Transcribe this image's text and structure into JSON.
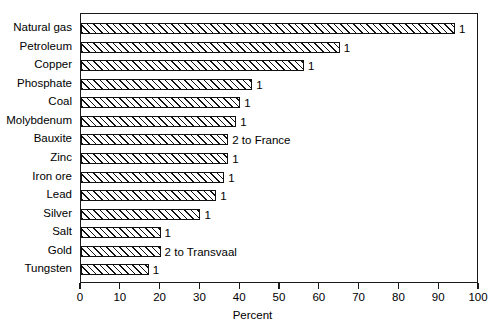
{
  "chart_data": {
    "type": "bar",
    "orientation": "horizontal",
    "title": "",
    "xlabel": "Percent",
    "ylabel": "",
    "xlim": [
      0,
      100
    ],
    "xticks": [
      0,
      10,
      20,
      30,
      40,
      50,
      60,
      70,
      80,
      90,
      100
    ],
    "xtick_labels": [
      "0",
      "10",
      "20",
      "30",
      "40",
      "50",
      "60",
      "70",
      "80",
      "90",
      "100"
    ],
    "grid": false,
    "legend": "none",
    "categories": [
      "Natural gas",
      "Petroleum",
      "Copper",
      "Phosphate",
      "Coal",
      "Molybdenum",
      "Bauxite",
      "Zinc",
      "Iron ore",
      "Lead",
      "Silver",
      "Salt",
      "Gold",
      "Tungsten"
    ],
    "values": [
      94,
      65,
      56,
      43,
      40,
      39,
      37,
      37,
      36,
      34,
      30,
      20,
      20,
      17
    ],
    "annotations": [
      "1",
      "1",
      "1",
      "1",
      "1",
      "1",
      "2 to France",
      "1",
      "1",
      "1",
      "1",
      "1",
      "2 to Transvaal",
      "1"
    ]
  }
}
